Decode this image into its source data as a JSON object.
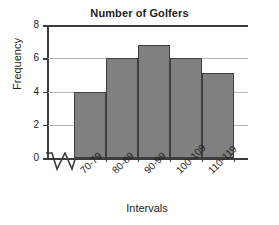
{
  "chart_data": {
    "type": "bar",
    "title": "Number of Golfers",
    "xlabel": "Intervals",
    "ylabel": "Frequency",
    "categories": [
      "70-79",
      "80-89",
      "90-99",
      "100-109",
      "110-119"
    ],
    "values": [
      4,
      6,
      6.8,
      6,
      5.1
    ],
    "ylim": [
      0,
      8
    ],
    "yticks": [
      0,
      2,
      4,
      6,
      8
    ],
    "ytick_labels": [
      "0",
      "2",
      "4",
      "6",
      "8"
    ],
    "grid": true,
    "grid_axis": "y",
    "legend": null,
    "bar_fill_color": "#808080",
    "bar_edge_color": "#3f3f3f",
    "axis_color": "#3c3c3c",
    "gridline_color": "#b9b9b9",
    "background_color": "#ffffff",
    "axis_break": "zigzag-on-x-axis-before-first-bar",
    "annotations": []
  },
  "figure": {
    "title": "Number of Golfers",
    "x_axis_title": "Intervals",
    "y_axis_title": "Frequency"
  }
}
